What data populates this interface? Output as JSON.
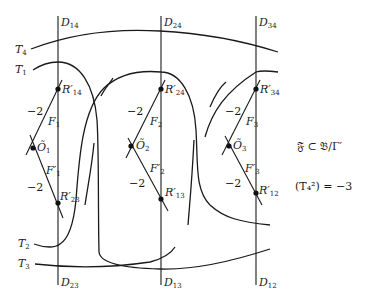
{
  "diagram": {
    "vertical_curves": [
      {
        "top_label": {
          "base": "D",
          "sub": "14"
        },
        "bottom_label": {
          "base": "D",
          "sub": "23"
        }
      },
      {
        "top_label": {
          "base": "D",
          "sub": "24"
        },
        "bottom_label": {
          "base": "D",
          "sub": "13"
        }
      },
      {
        "top_label": {
          "base": "D",
          "sub": "34"
        },
        "bottom_label": {
          "base": "D",
          "sub": "12"
        }
      }
    ],
    "horizontal_curves": [
      {
        "base": "T",
        "sub": "4"
      },
      {
        "base": "T",
        "sub": "1"
      },
      {
        "base": "T",
        "sub": "2"
      },
      {
        "base": "T",
        "sub": "3"
      }
    ],
    "fibre_groups": [
      {
        "upper_point": {
          "base": "R′",
          "sub": "14"
        },
        "upper_fibre": {
          "base": "F",
          "sub": "1"
        },
        "center_point": {
          "base": "Õ",
          "sub": "1"
        },
        "lower_fibre": {
          "base": "F′",
          "sub": "1"
        },
        "lower_point": {
          "base": "R′",
          "sub": "23"
        },
        "upper_self_intersection": "−2",
        "lower_self_intersection": "−2"
      },
      {
        "upper_point": {
          "base": "R′",
          "sub": "24"
        },
        "upper_fibre": {
          "base": "F",
          "sub": "2"
        },
        "center_point": {
          "base": "Õ",
          "sub": "2"
        },
        "lower_fibre": {
          "base": "F′",
          "sub": "2"
        },
        "lower_point": {
          "base": "R′",
          "sub": "13"
        },
        "upper_self_intersection": "−2",
        "lower_self_intersection": "−2"
      },
      {
        "upper_point": {
          "base": "R′",
          "sub": "34"
        },
        "upper_fibre": {
          "base": "F",
          "sub": "3"
        },
        "center_point": {
          "base": "Õ",
          "sub": "3"
        },
        "lower_fibre": {
          "base": "F′",
          "sub": "3"
        },
        "lower_point": {
          "base": "R′",
          "sub": "12"
        },
        "upper_self_intersection": "−2",
        "lower_self_intersection": "−2"
      }
    ],
    "annotations": {
      "inclusion": "𝔉 ⊂ 𝔅/Γ′",
      "self_intersection": "(T₄²) = −3"
    }
  }
}
